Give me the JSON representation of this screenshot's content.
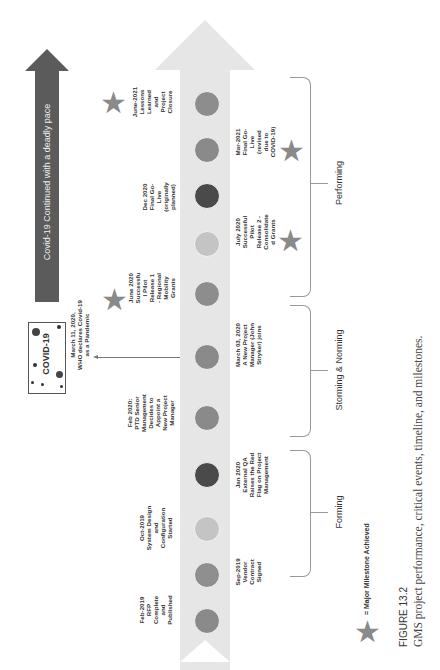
{
  "covid_arrow": {
    "label": "Covid-19 Continued with a deadly pace",
    "color": "#5b5b5b"
  },
  "covid_box": {
    "label": "COVID-19"
  },
  "who_event": {
    "label": "March 11, 2020,\nWHO declares Covid-19\nas a Pandemic"
  },
  "timeline_arrow": {
    "color": "#e6e6e6"
  },
  "events": [
    {
      "label": "Feb-2019\nRFP\nComplete\nand\nPublished",
      "side": "left",
      "circle_color": "#8a8a8a",
      "star": false
    },
    {
      "label": "Sep-2019\nVendor\nContract\nSigned",
      "side": "right",
      "circle_color": "#8f8f8f",
      "star": false
    },
    {
      "label": "Oct-2019\nSystem Design\nand\nConfiguration\nStarted",
      "side": "left",
      "circle_color": "#c4c4c4",
      "star": false
    },
    {
      "label": "Jan 2020\nExternal QA\nRaises the Red\nFlag on Project\nManagement",
      "side": "right",
      "circle_color": "#4a4a4a",
      "star": false
    },
    {
      "label": "Feb 2020:\nPTD Senior\nManagement\nDecides to\nAppoint a\nNew Project\nManager",
      "side": "left",
      "circle_color": "#8a8a8a",
      "star": false
    },
    {
      "label": "March 03, 2020\nA New Project\nManager (John\nStryker) joins",
      "side": "right",
      "circle_color": "#8a8a8a",
      "star": false
    },
    {
      "label": "June 2020\nSuccessfu\nl Pilot\nRelease 1\n- Regional\nMobility\nGrants",
      "side": "left",
      "circle_color": "#8d8d8d",
      "star": true
    },
    {
      "label": "July 2020\nSuccessful\nPilot\nRelease 2 -\nConsolidate\nd Grants",
      "side": "right",
      "circle_color": "#c4c4c4",
      "star": true
    },
    {
      "label": "Dec 2020\nFinal Go-\nLive\n(originally\nplanned)",
      "side": "left",
      "circle_color": "#4a4a4a",
      "star": false
    },
    {
      "label": "Mar-2021\nFinal Go-\nLive\n(revised\ndue to\nCOVID-19)",
      "side": "right",
      "circle_color": "#8a8a8a",
      "star": true
    },
    {
      "label": "June-2021\nLessons\nLearned\nand\nProject\nClosure",
      "side": "left",
      "circle_color": "#8d8d8d",
      "star": true
    }
  ],
  "phases": [
    {
      "label": "Forming"
    },
    {
      "label": "Storming & Norming"
    },
    {
      "label": "Performing"
    }
  ],
  "legend": {
    "star_icon": "star-icon",
    "label": "= Major Milestone Achieved"
  },
  "caption": {
    "figure": "FIGURE 13.2",
    "text": "GMS project performance, critical events, timeline, and milestones."
  }
}
